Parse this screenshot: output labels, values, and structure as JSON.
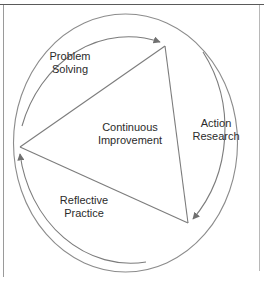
{
  "diagram": {
    "type": "cycle-triangle-in-circle",
    "background_color": "#ffffff",
    "stroke_color": "#808080",
    "text_color": "#2b2b2b",
    "center_label": {
      "line1": "Continuous",
      "line2": "Improvement",
      "text": "Continuous\nImprovement"
    },
    "segments": [
      {
        "id": "problem-solving",
        "line1": "Problem",
        "line2": "Solving",
        "text": "Problem\nSolving",
        "position": "upper-left"
      },
      {
        "id": "action-research",
        "line1": "Action",
        "line2": "Research",
        "text": "Action\nResearch",
        "position": "right"
      },
      {
        "id": "reflective-practice",
        "line1": "Reflective",
        "line2": "Practice",
        "text": "Reflective\nPractice",
        "position": "lower-left"
      }
    ],
    "geometry": {
      "circle": {
        "cx": 125.5,
        "cy": 143,
        "rx": 112,
        "ry": 129
      },
      "triangle_vertices": [
        {
          "name": "top",
          "x": 165,
          "y": 46
        },
        {
          "name": "bottom-right",
          "x": 188,
          "y": 223
        },
        {
          "name": "left",
          "x": 20,
          "y": 147
        }
      ],
      "arrow_targets": [
        "top",
        "bottom-right",
        "left"
      ],
      "flow_direction": "clockwise"
    }
  }
}
